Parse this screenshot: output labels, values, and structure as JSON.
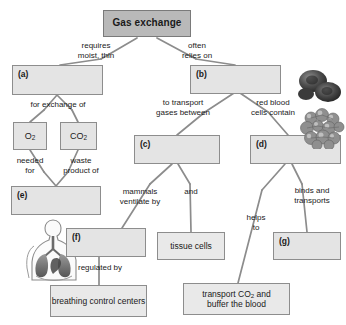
{
  "diagram": {
    "type": "concept-map",
    "title": "Gas exchange",
    "nodes": [
      {
        "id": "title",
        "label": "Gas exchange",
        "kind": "title"
      },
      {
        "id": "a",
        "label": "(a)",
        "kind": "blank"
      },
      {
        "id": "b",
        "label": "(b)",
        "kind": "blank"
      },
      {
        "id": "o2",
        "label": "O2",
        "kind": "term"
      },
      {
        "id": "co2",
        "label": "CO2",
        "kind": "term"
      },
      {
        "id": "c",
        "label": "(c)",
        "kind": "blank"
      },
      {
        "id": "d",
        "label": "(d)",
        "kind": "blank"
      },
      {
        "id": "e",
        "label": "(e)",
        "kind": "blank"
      },
      {
        "id": "f",
        "label": "(f)",
        "kind": "blank"
      },
      {
        "id": "g",
        "label": "(g)",
        "kind": "blank"
      },
      {
        "id": "tissue",
        "label": "tissue cells",
        "kind": "term"
      },
      {
        "id": "centers",
        "label": "breathing control centers",
        "kind": "term"
      },
      {
        "id": "buffer",
        "label": "transport CO2 and buffer the blood",
        "kind": "term"
      }
    ],
    "edge_labels": {
      "requires_moist_thin": "requires\nmoist, thin",
      "often_relies_on": "often\nrelies on",
      "for_exchange_of": "for exchange of",
      "to_transport_gases_between": "to transport\ngases between",
      "red_blood_cells_contain": "red blood\ncells contain",
      "needed_for": "needed\nfor",
      "waste_product_of": "waste\nproduct of",
      "mammals_ventilate_by": "mammals\nventilate by",
      "and": "and",
      "binds_and_transports": "binds and\ntransports",
      "helps_to": "helps\nto",
      "regulated_by": "regulated by"
    },
    "illustrations": [
      {
        "id": "red-blood-cells",
        "name": "red-blood-cells-image"
      },
      {
        "id": "hemoglobin",
        "name": "hemoglobin-molecule-image"
      },
      {
        "id": "respiratory-system",
        "name": "human-respiratory-system-image"
      }
    ],
    "colors": {
      "box_fill": "#e4e4e4",
      "box_border": "#8d8d8d",
      "title_fill": "#b9b9b9",
      "text": "#1a1a1a",
      "connector": "#8a8a8a",
      "background": "#ffffff"
    }
  }
}
